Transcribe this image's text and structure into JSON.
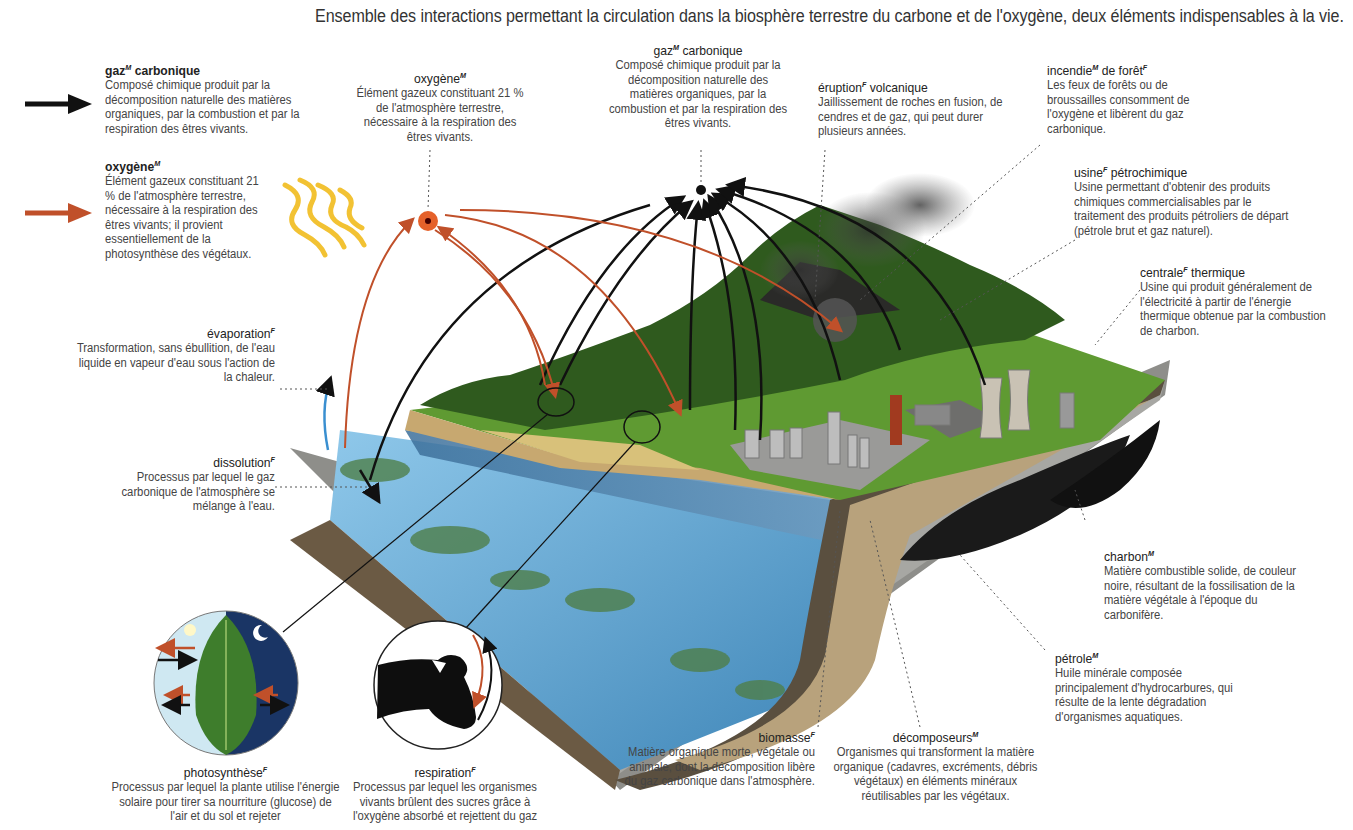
{
  "title": "Ensemble des interactions permettant la circulation dans la biosphère terrestre du carbone et de l'oxygène, deux éléments indispensables à la vie.",
  "legend": {
    "co2": {
      "arrow_color": "#111111",
      "term": "gaz",
      "gender": "M",
      "term_rest": " carbonique",
      "desc": "Composé chimique produit par la décomposition naturelle des matières organiques, par la combustion et par la respiration des êtres vivants."
    },
    "o2": {
      "arrow_color": "#c0502a",
      "term": "oxygène",
      "gender": "M",
      "desc": "Élément gazeux constituant 21 % de l'atmosphère terrestre, nécessaire à la respiration des êtres vivants; il provient essentiellement de la photosynthèse des végétaux."
    }
  },
  "labels": {
    "oxygene": {
      "term": "oxygène",
      "gender": "M",
      "desc": "Élément gazeux constituant 21 % de l'atmosphère terrestre, nécessaire à la respiration des êtres vivants."
    },
    "gaz_carbonique": {
      "term": "gaz",
      "gender": "M",
      "term_rest": " carbonique",
      "desc": "Composé chimique produit par la décomposition naturelle des matières organiques, par la combustion et par la respiration des êtres vivants."
    },
    "eruption": {
      "term": "éruption",
      "gender": "F",
      "term_rest": " volcanique",
      "desc": "Jaillissement de roches en fusion, de cendres et de gaz, qui peut durer plusieurs années."
    },
    "incendie": {
      "term": "incendie",
      "gender": "M",
      "term_rest": " de forêt",
      "gender2": "F",
      "desc": "Les feux de forêts ou de broussailles consomment de l'oxygène et libèrent du gaz carbonique."
    },
    "usine": {
      "term": "usine",
      "gender": "F",
      "term_rest": " pétrochimique",
      "desc": "Usine permettant d'obtenir des produits chimiques commercialisables par le traitement des produits pétroliers de départ (pétrole brut et gaz naturel)."
    },
    "centrale": {
      "term": "centrale",
      "gender": "F",
      "term_rest": " thermique",
      "desc": "Usine qui produit généralement de l'électricité à partir de l'énergie thermique obtenue par la combustion de charbon."
    },
    "evaporation": {
      "term": "évaporation",
      "gender": "F",
      "desc": "Transformation, sans ébullition, de l'eau liquide en vapeur d'eau sous l'action de la chaleur."
    },
    "dissolution": {
      "term": "dissolution",
      "gender": "F",
      "desc": "Processus par lequel le gaz carbonique de l'atmosphère se mélange à l'eau."
    },
    "charbon": {
      "term": "charbon",
      "gender": "M",
      "desc": "Matière combustible solide, de couleur noire, résultant de la fossilisation de la matière végétale à l'époque du carbonifère."
    },
    "petrole": {
      "term": "pétrole",
      "gender": "M",
      "desc": "Huile minérale composée principalement d'hydrocarbures, qui résulte de la lente dégradation d'organismes aquatiques."
    },
    "biomasse": {
      "term": "biomasse",
      "gender": "F",
      "desc": "Matière organique morte, végétale ou animale, dont la décomposition libère du gaz carbonique dans l'atmosphère."
    },
    "decomposeurs": {
      "term": "décomposeurs",
      "gender": "M",
      "desc": "Organismes qui transforment la matière organique (cadavres, excréments, débris végétaux) en éléments minéraux réutilisables par les végétaux."
    },
    "photosynthese": {
      "term": "photosynthèse",
      "gender": "F",
      "desc": "Processus par lequel la plante utilise l'énergie solaire pour tirer sa nourriture (glucose) de l'air et du sol et rejeter"
    },
    "respiration": {
      "term": "respiration",
      "gender": "F",
      "desc": "Processus par lequel les organismes vivants brûlent des sucres grâce à l'oxygène absorbé et rejettent du gaz"
    }
  },
  "colors": {
    "co2_arrow": "#111111",
    "o2_arrow": "#c0502a",
    "water": "#6fb3dc",
    "grass": "#5a8f2a",
    "soil": "#b9a27c",
    "rock": "#9a9a96",
    "sun_rays": "#f2c233"
  }
}
